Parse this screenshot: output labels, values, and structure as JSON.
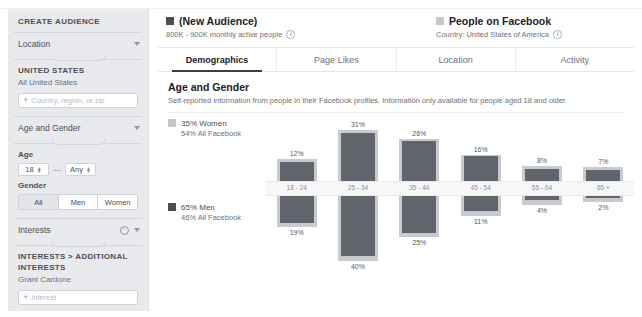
{
  "sidebar": {
    "title": "CREATE AUDIENCE",
    "sections": {
      "location": {
        "header": "Location",
        "country_heading": "UNITED STATES",
        "country_sub": "All United States",
        "input_placeholder": "Country, region, or zip",
        "add_icon": "+"
      },
      "age_gender": {
        "header": "Age and Gender",
        "age_label": "Age",
        "age_min": "18",
        "age_max": "Any",
        "range_dash": "—",
        "gender_label": "Gender",
        "gender_options": [
          "All",
          "Men",
          "Women"
        ],
        "gender_selected": "All"
      },
      "interests": {
        "header": "Interests",
        "breadcrumb": "INTERESTS > ADDITIONAL INTERESTS",
        "selected": "Grant Cardone",
        "input_placeholder": "Interest",
        "add_icon": "+"
      }
    }
  },
  "main": {
    "summary": {
      "audience": {
        "title": "(New Audience)",
        "subtitle": "800K - 900K monthly active people",
        "info_glyph": "i",
        "swatch_color": "#4a4f57"
      },
      "benchmark": {
        "title": "People on Facebook",
        "subtitle": "Country: United States of America",
        "info_glyph": "i",
        "swatch_color": "#c4c7cc"
      }
    },
    "tabs": [
      {
        "label": "Demographics",
        "active": true
      },
      {
        "label": "Page Likes",
        "active": false
      },
      {
        "label": "Location",
        "active": false
      },
      {
        "label": "Activity",
        "active": false
      }
    ],
    "section": {
      "title": "Age and Gender",
      "subtitle": "Self-reported information from people in their Facebook profiles. Information only available for people aged 18 and older."
    },
    "legend": {
      "women": {
        "main": "35% Women",
        "sub": "54% All Facebook"
      },
      "men": {
        "main": "65% Men",
        "sub": "46% All Facebook"
      }
    }
  },
  "chart_data": {
    "type": "bar",
    "title": "Age and Gender",
    "subtitle": "Self-reported information from people in their Facebook profiles. Information only available for people aged 18 and older.",
    "xlabel": "",
    "ylabel": "",
    "grid": false,
    "legend_position": "left",
    "orientation": "diverging-vertical",
    "categories": [
      "18 - 24",
      "25 - 34",
      "35 - 44",
      "45 - 54",
      "55 - 64",
      "65 +"
    ],
    "series": [
      {
        "name": "35% Women",
        "direction": "up",
        "color": "#60646c",
        "values": [
          12,
          31,
          26,
          16,
          8,
          7
        ],
        "labels": [
          "12%",
          "31%",
          "26%",
          "16%",
          "8%",
          "7%"
        ]
      },
      {
        "name": "65% Men",
        "direction": "down",
        "color": "#60646c",
        "values": [
          19,
          40,
          25,
          11,
          4,
          2
        ],
        "labels": [
          "19%",
          "40%",
          "25%",
          "11%",
          "4%",
          "2%"
        ]
      },
      {
        "name": "People on Facebook (Women benchmark)",
        "direction": "up",
        "color": "#c8cacf",
        "values": [
          14,
          33,
          27,
          17,
          10,
          9
        ],
        "labels": []
      },
      {
        "name": "People on Facebook (Men benchmark)",
        "direction": "down",
        "color": "#c8cacf",
        "values": [
          21,
          43,
          28,
          14,
          7,
          5
        ],
        "labels": []
      }
    ]
  }
}
